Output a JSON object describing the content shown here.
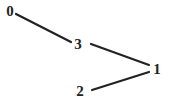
{
  "graph": {
    "nodes": [
      {
        "id": "0",
        "label": "0",
        "x": 10,
        "y": 16
      },
      {
        "id": "3",
        "label": "3",
        "x": 78,
        "y": 49
      },
      {
        "id": "1",
        "label": "1",
        "x": 157,
        "y": 74
      },
      {
        "id": "2",
        "label": "2",
        "x": 80,
        "y": 96
      }
    ],
    "edges": [
      {
        "from": "0",
        "to": "3",
        "x1": 16,
        "y1": 14,
        "x2": 71,
        "y2": 42
      },
      {
        "from": "3",
        "to": "1",
        "x1": 91,
        "y1": 44,
        "x2": 149,
        "y2": 65
      },
      {
        "from": "2",
        "to": "1",
        "x1": 92,
        "y1": 90,
        "x2": 149,
        "y2": 72
      }
    ],
    "colors": {
      "stroke": "#222222",
      "background": "#ffffff"
    }
  }
}
